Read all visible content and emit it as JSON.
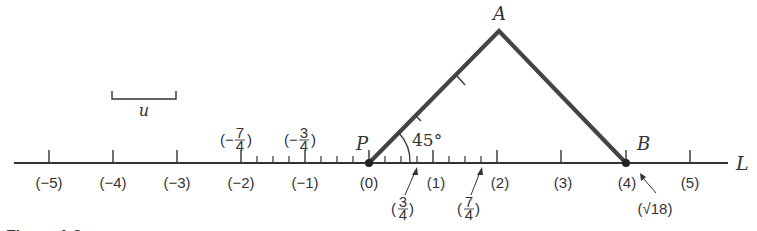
{
  "diagram": {
    "caption": "Figure 1.8",
    "line_label": "L",
    "unit_label": "u",
    "points": {
      "P": {
        "label": "P",
        "value": "(0)"
      },
      "A": {
        "label": "A"
      },
      "B": {
        "label": "B",
        "value": "(4)",
        "annotation": "(√18)"
      }
    },
    "angle_label": "45°",
    "integer_ticks": [
      {
        "value": -5,
        "label": "(−5)"
      },
      {
        "value": -4,
        "label": "(−4)"
      },
      {
        "value": -3,
        "label": "(−3)"
      },
      {
        "value": -2,
        "label": "(−2)"
      },
      {
        "value": -1,
        "label": "(−1)"
      },
      {
        "value": 0,
        "label": "(0)"
      },
      {
        "value": 1,
        "label": "(1)"
      },
      {
        "value": 2,
        "label": "(2)"
      },
      {
        "value": 3,
        "label": "(3)"
      },
      {
        "value": 4,
        "label": "(4)"
      },
      {
        "value": 5,
        "label": "(5)"
      }
    ],
    "fraction_labels_above": [
      {
        "value": -1.75,
        "num": "7",
        "den": "4",
        "sign": "−"
      },
      {
        "value": -0.75,
        "num": "3",
        "den": "4",
        "sign": "−"
      }
    ],
    "fraction_labels_below": [
      {
        "value": 0.75,
        "num": "3",
        "den": "4",
        "sign": ""
      },
      {
        "value": 1.75,
        "num": "7",
        "den": "4",
        "sign": ""
      }
    ],
    "colors": {
      "line": "#333333",
      "triangle": "#444444",
      "text": "#333333"
    }
  }
}
